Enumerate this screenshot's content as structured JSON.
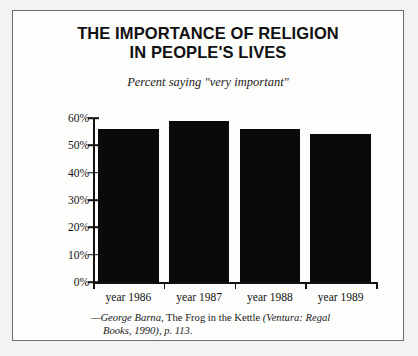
{
  "figure": {
    "title_line1": "THE IMPORTANCE OF RELIGION",
    "title_line2": "IN PEOPLE'S LIVES",
    "subtitle": "Percent saying \"very important\""
  },
  "citation": {
    "author": "—George Barna,",
    "work_roman": " The Frog in the Kettle ",
    "place_italic": "(Ventura: Regal",
    "line2_italic": "Books, 1990), p. 113."
  },
  "axis": {
    "yticks": [
      "60%",
      "50%",
      "40%",
      "30%",
      "20%",
      "10%",
      "0%"
    ]
  },
  "colors": {
    "bar": "#0a0a0a",
    "axis": "#111111",
    "frame": "#6c6c6c",
    "page": "#fdfdfc"
  },
  "chart_data": {
    "type": "bar",
    "title": "THE IMPORTANCE OF RELIGION IN PEOPLE'S LIVES",
    "subtitle": "Percent saying \"very important\"",
    "categories": [
      "year 1986",
      "year 1987",
      "year 1988",
      "year 1989"
    ],
    "values": [
      56,
      59,
      56,
      54
    ],
    "xlabel": "",
    "ylabel": "",
    "ylim": [
      0,
      60
    ],
    "ytick_values": [
      0,
      10,
      20,
      30,
      40,
      50,
      60
    ],
    "ytick_labels": [
      "0%",
      "10%",
      "20%",
      "30%",
      "40%",
      "50%",
      "60%"
    ],
    "grid": false,
    "legend": false,
    "source": "—George Barna, The Frog in the Kettle (Ventura: Regal Books, 1990), p. 113."
  }
}
